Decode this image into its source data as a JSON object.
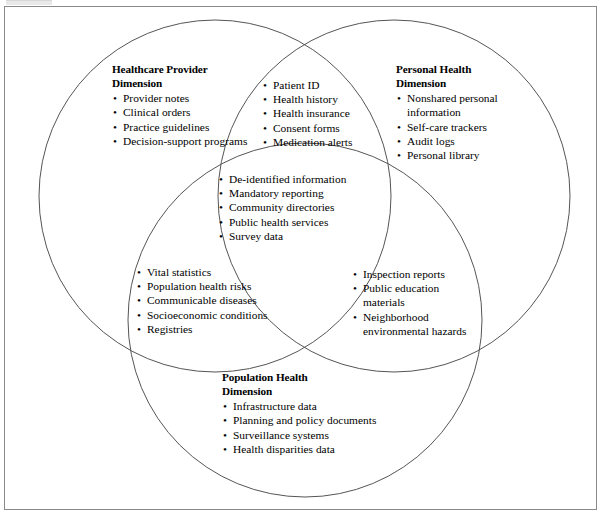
{
  "figure": {
    "type": "three-circle-venn-diagram",
    "background_color": "#ffffff",
    "stroke_color": "#555555",
    "frame_color": "#8a8a8a",
    "text_color": "#000000"
  },
  "circles": [
    {
      "name": "healthcare-provider-dimension",
      "cx": 215,
      "cy": 196,
      "r": 176
    },
    {
      "name": "personal-health-dimension",
      "cx": 394,
      "cy": 196,
      "r": 176
    },
    {
      "name": "population-health-dimension",
      "cx": 305,
      "cy": 320,
      "r": 177
    }
  ],
  "regions": {
    "provider_only": {
      "heading": "Healthcare Provider\nDimension",
      "items": [
        "Provider notes",
        "Clinical orders",
        "Practice guidelines",
        "Decision-support programs"
      ]
    },
    "personal_only": {
      "heading": "Personal Health\nDimension",
      "items": [
        "Nonshared personal information",
        "Self-care trackers",
        "Audit logs",
        "Personal library"
      ]
    },
    "population_only": {
      "heading": "Population Health\nDimension",
      "items": [
        "Infrastructure data",
        "Planning and policy documents",
        "Surveillance systems",
        "Health disparities data"
      ]
    },
    "provider_personal": {
      "heading": "",
      "items": [
        "Patient ID",
        "Health history",
        "Health insurance",
        "Consent forms",
        "Medication alerts"
      ]
    },
    "provider_population": {
      "heading": "",
      "items": [
        "Vital statistics",
        "Population health risks",
        "Communicable diseases",
        "Socioeconomic conditions",
        "Registries"
      ]
    },
    "personal_population": {
      "heading": "",
      "items": [
        "Inspection reports",
        "Public education materials",
        "Neighborhood environmental hazards"
      ]
    },
    "center_all_three": {
      "heading": "",
      "items": [
        "De-identified information",
        "Mandatory reporting",
        "Community directories",
        "Public health services",
        "Survey data"
      ]
    }
  },
  "bullet_glyph": "•"
}
